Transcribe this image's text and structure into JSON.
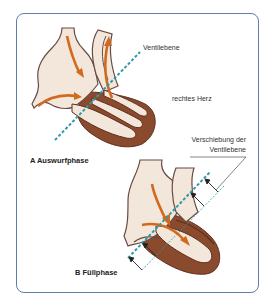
{
  "figure": {
    "labels": {
      "valve_plane": "Ventilebene",
      "right_heart": "rechtes Herz",
      "shift_line1": "Verschiebung der",
      "shift_line2": "Ventilebene",
      "panel_a": "A  Auswurfphase",
      "panel_b": "B  Füllphase"
    },
    "colors": {
      "frame": "#5f7fa8",
      "tissue_fill": "#f3e6da",
      "muscle": "#8a4a2e",
      "muscle_dark": "#5e2e1c",
      "arrow": "#d26a1e",
      "valve_plane_line": "#2f9aa8",
      "shift_arrow": "#222222"
    },
    "panels": [
      {
        "id": "A",
        "phase": "Auswurfphase"
      },
      {
        "id": "B",
        "phase": "Füllphase"
      }
    ]
  }
}
